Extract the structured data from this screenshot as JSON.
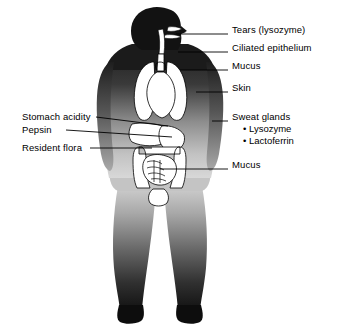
{
  "diagram": {
    "figure": "human-body-silhouette-with-internal-organs",
    "view": "anterior full body, head in right-facing profile",
    "background_color": "#ffffff",
    "body_color_dark": "#1a1a1a",
    "body_color_mid": "#6e6e6e",
    "body_color_light": "#b8b8b8",
    "organ_fill": "#ffffff",
    "organ_stroke": "#000000",
    "leader_color": "#000000"
  },
  "labels_right": [
    {
      "id": "tears",
      "text": "Tears (lysozyme)",
      "x": 232,
      "y": 30,
      "leader_from_x": 176,
      "leader_from_y": 34,
      "leader_to_x": 228,
      "leader_to_y": 34
    },
    {
      "id": "ciliated-epithelium",
      "text": "Ciliated epithelium",
      "x": 232,
      "y": 48,
      "leader_from_x": 178,
      "leader_from_y": 52,
      "leader_to_x": 228,
      "leader_to_y": 52
    },
    {
      "id": "mucus-upper",
      "text": "Mucus",
      "x": 232,
      "y": 66,
      "leader_from_x": 180,
      "leader_from_y": 70,
      "leader_to_x": 228,
      "leader_to_y": 70
    },
    {
      "id": "skin",
      "text": "Skin",
      "x": 232,
      "y": 88,
      "leader_from_x": 196,
      "leader_from_y": 92,
      "leader_to_x": 228,
      "leader_to_y": 92
    },
    {
      "id": "sweat-glands",
      "text": "Sweat glands",
      "x": 232,
      "y": 117,
      "leader_from_x": 212,
      "leader_from_y": 121,
      "leader_to_x": 228,
      "leader_to_y": 121
    },
    {
      "id": "mucus-lower",
      "text": "Mucus",
      "x": 232,
      "y": 165,
      "leader_from_x": 160,
      "leader_from_y": 169,
      "leader_to_x": 228,
      "leader_to_y": 169
    }
  ],
  "sublabels_sweat_glands": [
    {
      "id": "lysozyme",
      "text": "Lysozyme",
      "x": 243,
      "y": 129
    },
    {
      "id": "lactoferrin",
      "text": "Lactoferrin",
      "x": 243,
      "y": 141
    }
  ],
  "labels_left": [
    {
      "id": "stomach-acidity",
      "text": "Stomach acidity",
      "x": 22,
      "y": 113,
      "leader_from_x": 96,
      "leader_from_y": 117,
      "leader_to_x": 168,
      "leader_to_y": 126
    },
    {
      "id": "pepsin",
      "text": "Pepsin",
      "x": 22,
      "y": 126,
      "leader_from_x": 66,
      "leader_from_y": 130,
      "leader_to_x": 172,
      "leader_to_y": 137
    },
    {
      "id": "resident-flora",
      "text": "Resident flora",
      "x": 22,
      "y": 144,
      "leader_from_x": 90,
      "leader_from_y": 148,
      "leader_to_x": 152,
      "leader_to_y": 148
    }
  ],
  "bullet_glyph": "•"
}
